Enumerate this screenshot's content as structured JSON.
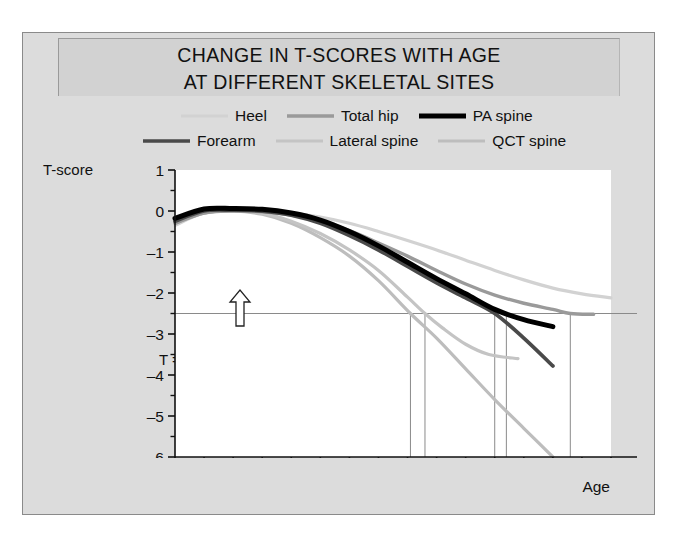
{
  "title": {
    "line1": "CHANGE IN T-SCORES WITH AGE",
    "line2": "AT DIFFERENT SKELETAL SITES"
  },
  "axis_titles": {
    "y": "T-score",
    "x": "Age"
  },
  "annotation": {
    "threshold_label": "T = –2.5",
    "arrow": "up-arrow-outline"
  },
  "legend": {
    "row1": [
      {
        "label": "Heel",
        "color": "#d2d2d2",
        "width": 3
      },
      {
        "label": "Total hip",
        "color": "#9a9a9a",
        "width": 3.4
      },
      {
        "label": "PA spine",
        "color": "#000000",
        "width": 5
      }
    ],
    "row2": [
      {
        "label": "Forearm",
        "color": "#4a4a4a",
        "width": 3.6
      },
      {
        "label": "Lateral spine",
        "color": "#c4c4c4",
        "width": 3
      },
      {
        "label": "QCT spine",
        "color": "#bdbdbd",
        "width": 3
      }
    ]
  },
  "chart_data": {
    "type": "line",
    "title": "CHANGE IN T-SCORES WITH AGE AT DIFFERENT SKELETAL SITES",
    "xlabel": "Age",
    "ylabel": "T-score",
    "xlim": [
      20,
      95
    ],
    "ylim": [
      -6,
      1
    ],
    "xticks": [
      20,
      25,
      30,
      35,
      40,
      45,
      50,
      55,
      60,
      65,
      70,
      75,
      80,
      85,
      90,
      95
    ],
    "xtick_labels": [
      "20",
      "25",
      "30",
      "35",
      "40",
      "45",
      "50",
      "55",
      "60",
      "65",
      "70",
      "75",
      "80",
      "85",
      "90",
      "95"
    ],
    "yticks": [
      1,
      0,
      -1,
      -2,
      -3,
      -4,
      -5,
      -6
    ],
    "ytick_labels": [
      "1",
      "0",
      "–1",
      "–2",
      "–3",
      "–4",
      "–5",
      "–6"
    ],
    "minor_yticks": [
      0.5,
      -0.5,
      -1.5,
      -2.5,
      -3.5,
      -4.5,
      -5.5
    ],
    "grid": false,
    "legend_position": "above-plot",
    "threshold_line": {
      "y": -2.5,
      "label": "T = –2.5",
      "color": "#8a8a8a"
    },
    "threshold_crossings": [
      {
        "series": "QCT spine",
        "age": 60.5
      },
      {
        "series": "Lateral spine",
        "age": 63
      },
      {
        "series": "Forearm",
        "age": 75
      },
      {
        "series": "PA spine",
        "age": 77
      },
      {
        "series": "Total hip",
        "age": 88
      }
    ],
    "series": [
      {
        "name": "Heel",
        "color": "#d2d2d2",
        "width": 3.2,
        "points": [
          [
            20,
            -0.35
          ],
          [
            25,
            -0.05
          ],
          [
            30,
            0.0
          ],
          [
            35,
            0.0
          ],
          [
            40,
            -0.05
          ],
          [
            45,
            -0.15
          ],
          [
            50,
            -0.3
          ],
          [
            55,
            -0.5
          ],
          [
            60,
            -0.72
          ],
          [
            65,
            -0.95
          ],
          [
            70,
            -1.2
          ],
          [
            75,
            -1.45
          ],
          [
            80,
            -1.68
          ],
          [
            85,
            -1.88
          ],
          [
            90,
            -2.02
          ],
          [
            95,
            -2.12
          ]
        ]
      },
      {
        "name": "Total hip",
        "color": "#9a9a9a",
        "width": 3.4,
        "points": [
          [
            20,
            -0.3
          ],
          [
            25,
            -0.05
          ],
          [
            30,
            0.0
          ],
          [
            35,
            -0.02
          ],
          [
            40,
            -0.1
          ],
          [
            45,
            -0.25
          ],
          [
            50,
            -0.48
          ],
          [
            55,
            -0.78
          ],
          [
            60,
            -1.1
          ],
          [
            65,
            -1.45
          ],
          [
            70,
            -1.78
          ],
          [
            75,
            -2.05
          ],
          [
            80,
            -2.25
          ],
          [
            85,
            -2.4
          ],
          [
            88,
            -2.5
          ],
          [
            92,
            -2.52
          ]
        ]
      },
      {
        "name": "PA spine",
        "color": "#000000",
        "width": 5.0,
        "points": [
          [
            20,
            -0.18
          ],
          [
            25,
            0.05
          ],
          [
            30,
            0.06
          ],
          [
            35,
            0.04
          ],
          [
            40,
            -0.05
          ],
          [
            45,
            -0.22
          ],
          [
            50,
            -0.5
          ],
          [
            55,
            -0.85
          ],
          [
            60,
            -1.25
          ],
          [
            65,
            -1.65
          ],
          [
            70,
            -2.02
          ],
          [
            75,
            -2.4
          ],
          [
            80,
            -2.65
          ],
          [
            85,
            -2.82
          ]
        ]
      },
      {
        "name": "Forearm",
        "color": "#4a4a4a",
        "width": 3.8,
        "points": [
          [
            20,
            -0.25
          ],
          [
            25,
            0.0
          ],
          [
            30,
            0.02
          ],
          [
            35,
            0.0
          ],
          [
            40,
            -0.1
          ],
          [
            45,
            -0.3
          ],
          [
            50,
            -0.6
          ],
          [
            55,
            -0.95
          ],
          [
            60,
            -1.35
          ],
          [
            65,
            -1.75
          ],
          [
            70,
            -2.12
          ],
          [
            75,
            -2.5
          ],
          [
            80,
            -3.1
          ],
          [
            85,
            -3.78
          ]
        ]
      },
      {
        "name": "Lateral spine",
        "color": "#c4c4c4",
        "width": 3.2,
        "points": [
          [
            20,
            -0.3
          ],
          [
            25,
            -0.05
          ],
          [
            30,
            0.0
          ],
          [
            35,
            -0.05
          ],
          [
            40,
            -0.25
          ],
          [
            45,
            -0.55
          ],
          [
            50,
            -0.95
          ],
          [
            55,
            -1.45
          ],
          [
            60,
            -2.1
          ],
          [
            63,
            -2.5
          ],
          [
            66,
            -2.85
          ],
          [
            70,
            -3.25
          ],
          [
            74,
            -3.5
          ],
          [
            79,
            -3.6
          ]
        ]
      },
      {
        "name": "QCT spine",
        "color": "#bdbdbd",
        "width": 3.2,
        "points": [
          [
            20,
            -0.3
          ],
          [
            25,
            -0.05
          ],
          [
            30,
            0.0
          ],
          [
            35,
            -0.08
          ],
          [
            40,
            -0.3
          ],
          [
            45,
            -0.65
          ],
          [
            50,
            -1.1
          ],
          [
            55,
            -1.7
          ],
          [
            60.5,
            -2.5
          ],
          [
            65,
            -3.1
          ],
          [
            70,
            -3.85
          ],
          [
            75,
            -4.6
          ],
          [
            80,
            -5.3
          ],
          [
            85,
            -6.0
          ]
        ]
      }
    ]
  }
}
